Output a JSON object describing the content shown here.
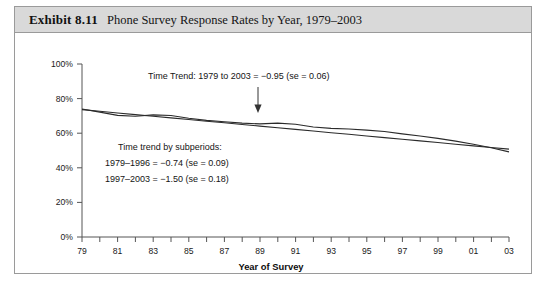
{
  "figure": {
    "exhibit_label": "Exhibit 8.11",
    "title": "Phone Survey Response Rates by Year, 1979–2003",
    "header_bg": "#d9d9d9",
    "border_color": "#9a9a9a"
  },
  "annotations": {
    "trend_overall": "Time Trend: 1979 to 2003 = −0.95 (se = 0.06)",
    "subperiod_heading": "Time trend by subperiods:",
    "subperiod_1": "1979–1996 = −0.74 (se = 0.09)",
    "subperiod_2": "1997–2003 = −1.50 (se = 0.18)",
    "arrow": "down-arrow-icon"
  },
  "chart_data": {
    "type": "line",
    "title": "Phone Survey Response Rates by Year, 1979–2003",
    "xlabel": "Year of Survey",
    "ylabel": "",
    "xlim": [
      1979,
      2003
    ],
    "ylim": [
      0,
      100
    ],
    "grid": false,
    "legend": "none",
    "ytick_labels": [
      "0%",
      "20%",
      "40%",
      "60%",
      "80%",
      "100%"
    ],
    "ytick_values": [
      0,
      20,
      40,
      60,
      80,
      100
    ],
    "xtick_labels": [
      "79",
      "81",
      "83",
      "85",
      "87",
      "89",
      "91",
      "93",
      "95",
      "97",
      "99",
      "01",
      "03"
    ],
    "xtick_values": [
      1979,
      1981,
      1983,
      1985,
      1987,
      1989,
      1991,
      1993,
      1995,
      1997,
      1999,
      2001,
      2003
    ],
    "x": [
      1979,
      1980,
      1981,
      1982,
      1983,
      1984,
      1985,
      1986,
      1987,
      1988,
      1989,
      1990,
      1991,
      1992,
      1993,
      1994,
      1995,
      1996,
      1997,
      1998,
      1999,
      2000,
      2001,
      2002,
      2003
    ],
    "series": [
      {
        "name": "Response rate",
        "values": [
          74.0,
          72.2,
          70.3,
          69.8,
          70.6,
          70.2,
          68.6,
          67.4,
          66.6,
          65.8,
          65.4,
          65.8,
          65.2,
          63.6,
          62.8,
          62.4,
          61.8,
          61.0,
          59.6,
          58.4,
          57.0,
          55.4,
          53.6,
          51.6,
          49.2
        ]
      },
      {
        "name": "Fitted linear trend",
        "values": [
          73.6,
          72.65,
          71.7,
          70.75,
          69.8,
          68.85,
          67.9,
          66.95,
          66.0,
          65.05,
          64.1,
          63.15,
          62.2,
          61.25,
          60.3,
          59.35,
          58.4,
          57.45,
          56.5,
          55.55,
          54.6,
          53.65,
          52.7,
          51.75,
          50.8
        ]
      }
    ]
  },
  "axis": {
    "x_title": "Year of Survey"
  }
}
